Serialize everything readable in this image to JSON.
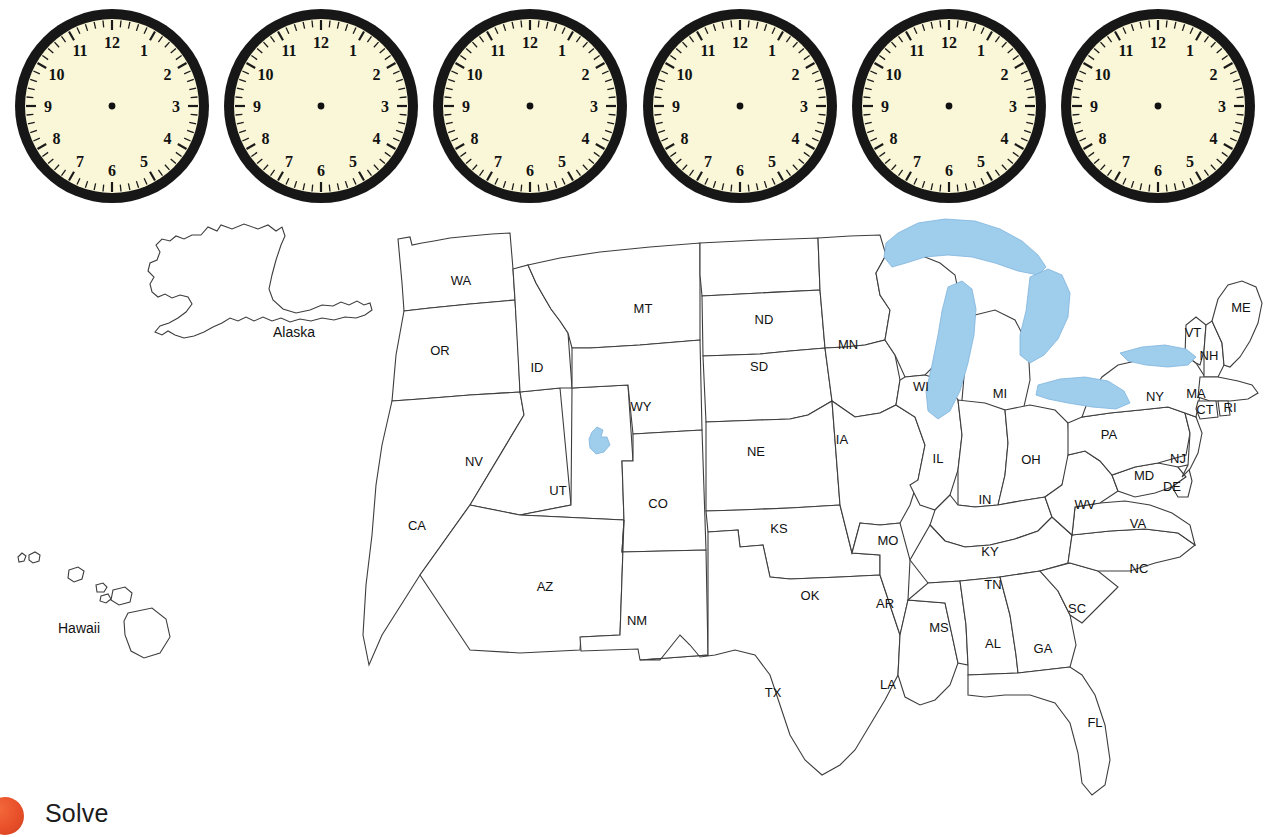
{
  "clocks": {
    "count": 6,
    "face_color": "#faf7d8",
    "bezel_color": "#171717",
    "hands": "none",
    "hour_numbers": [
      "12",
      "1",
      "2",
      "3",
      "4",
      "5",
      "6",
      "7",
      "8",
      "9",
      "10",
      "11"
    ],
    "items": [
      {
        "id": "clock-1",
        "hour_hand": null,
        "minute_hand": null
      },
      {
        "id": "clock-2",
        "hour_hand": null,
        "minute_hand": null
      },
      {
        "id": "clock-3",
        "hour_hand": null,
        "minute_hand": null
      },
      {
        "id": "clock-4",
        "hour_hand": null,
        "minute_hand": null
      },
      {
        "id": "clock-5",
        "hour_hand": null,
        "minute_hand": null
      },
      {
        "id": "clock-6",
        "hour_hand": null,
        "minute_hand": null
      }
    ]
  },
  "map": {
    "title": "",
    "lake_color": "#9fcdec",
    "outline_color": "#3d3d3d",
    "insets": [
      {
        "name": "Alaska",
        "label": "Alaska"
      },
      {
        "name": "Hawaii",
        "label": "Hawaii"
      }
    ],
    "state_labels": [
      {
        "abbr": "WA",
        "x": 461,
        "y": 77
      },
      {
        "abbr": "OR",
        "x": 440,
        "y": 147
      },
      {
        "abbr": "ID",
        "x": 537,
        "y": 164
      },
      {
        "abbr": "MT",
        "x": 643,
        "y": 105
      },
      {
        "abbr": "ND",
        "x": 764,
        "y": 116
      },
      {
        "abbr": "SD",
        "x": 759,
        "y": 163
      },
      {
        "abbr": "MN",
        "x": 848,
        "y": 141
      },
      {
        "abbr": "WY",
        "x": 641,
        "y": 203
      },
      {
        "abbr": "NE",
        "x": 756,
        "y": 248
      },
      {
        "abbr": "IA",
        "x": 842,
        "y": 236
      },
      {
        "abbr": "WI",
        "x": 921,
        "y": 183
      },
      {
        "abbr": "MI",
        "x": 1000,
        "y": 190
      },
      {
        "abbr": "NV",
        "x": 474,
        "y": 258
      },
      {
        "abbr": "UT",
        "x": 558,
        "y": 287
      },
      {
        "abbr": "CO",
        "x": 658,
        "y": 300
      },
      {
        "abbr": "KS",
        "x": 779,
        "y": 325
      },
      {
        "abbr": "IL",
        "x": 938,
        "y": 255
      },
      {
        "abbr": "IN",
        "x": 985,
        "y": 296
      },
      {
        "abbr": "OH",
        "x": 1031,
        "y": 256
      },
      {
        "abbr": "PA",
        "x": 1109,
        "y": 231
      },
      {
        "abbr": "NY",
        "x": 1155,
        "y": 193
      },
      {
        "abbr": "VT",
        "x": 1193,
        "y": 129
      },
      {
        "abbr": "NH",
        "x": 1209,
        "y": 152
      },
      {
        "abbr": "ME",
        "x": 1241,
        "y": 104
      },
      {
        "abbr": "MA",
        "x": 1196,
        "y": 190
      },
      {
        "abbr": "CT",
        "x": 1205,
        "y": 206
      },
      {
        "abbr": "RI",
        "x": 1230,
        "y": 204
      },
      {
        "abbr": "NJ",
        "x": 1178,
        "y": 255
      },
      {
        "abbr": "MD",
        "x": 1144,
        "y": 272
      },
      {
        "abbr": "DE",
        "x": 1172,
        "y": 283
      },
      {
        "abbr": "WV",
        "x": 1085,
        "y": 301
      },
      {
        "abbr": "VA",
        "x": 1138,
        "y": 320
      },
      {
        "abbr": "CA",
        "x": 417,
        "y": 322
      },
      {
        "abbr": "MO",
        "x": 888,
        "y": 337
      },
      {
        "abbr": "KY",
        "x": 990,
        "y": 348
      },
      {
        "abbr": "NC",
        "x": 1139,
        "y": 365
      },
      {
        "abbr": "TN",
        "x": 993,
        "y": 381
      },
      {
        "abbr": "AZ",
        "x": 545,
        "y": 383
      },
      {
        "abbr": "NM",
        "x": 637,
        "y": 417
      },
      {
        "abbr": "OK",
        "x": 810,
        "y": 392
      },
      {
        "abbr": "AR",
        "x": 885,
        "y": 400
      },
      {
        "abbr": "MS",
        "x": 939,
        "y": 424
      },
      {
        "abbr": "AL",
        "x": 993,
        "y": 440
      },
      {
        "abbr": "GA",
        "x": 1043,
        "y": 445
      },
      {
        "abbr": "SC",
        "x": 1077,
        "y": 405
      },
      {
        "abbr": "LA",
        "x": 888,
        "y": 481
      },
      {
        "abbr": "TX",
        "x": 773,
        "y": 489
      },
      {
        "abbr": "FL",
        "x": 1095,
        "y": 519
      }
    ]
  },
  "footer": {
    "solve_label": "Solve",
    "dot_color": "#e8502a"
  }
}
